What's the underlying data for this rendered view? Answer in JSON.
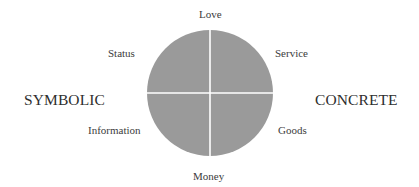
{
  "diagram": {
    "type": "resource-exchange-circle",
    "circle": {
      "fill": "#9a9a9a",
      "divider_color": "#ffffff",
      "quadrants": 4
    },
    "resources": {
      "top": "Love",
      "bottom": "Money",
      "upper_left": "Status",
      "upper_right": "Service",
      "lower_left": "Information",
      "lower_right": "Goods"
    },
    "axis_labels": {
      "left": "SYMBOLIC",
      "right": "CONCRETE"
    }
  }
}
